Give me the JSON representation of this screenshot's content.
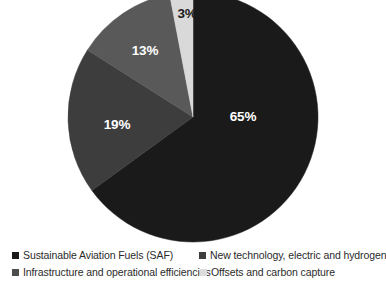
{
  "chart_data": {
    "type": "pie",
    "title": "",
    "subtitle": "",
    "xlabel": "",
    "ylabel": "",
    "grid": false,
    "legend_position": "bottom",
    "legend_columns": 2,
    "start_angle_deg": 0,
    "direction": "clockwise",
    "units": "percent",
    "total": 100,
    "categories": [
      "Sustainable Aviation Fuels (SAF)",
      "New technology, electric and hydrogen",
      "Infrastructure and operational efficiencies",
      "Offsets and carbon capture"
    ],
    "values": [
      65,
      19,
      13,
      3
    ],
    "data_labels": [
      "65%",
      "19%",
      "13%",
      "3%"
    ],
    "colors": [
      "#1a1a1a",
      "#3d3d3d",
      "#595959",
      "#d9d9d9"
    ],
    "slices": [
      {
        "label": "Sustainable Aviation Fuels (SAF)",
        "value": 65,
        "data_label": "65%",
        "color": "#1a1a1a",
        "label_color": "#ffffff",
        "label_x": 243,
        "label_y": 117
      },
      {
        "label": "New technology, electric and hydrogen",
        "value": 19,
        "data_label": "19%",
        "color": "#3d3d3d",
        "label_color": "#ffffff",
        "label_x": 117,
        "label_y": 125
      },
      {
        "label": "Infrastructure and operational efficiencies",
        "value": 13,
        "data_label": "13%",
        "color": "#595959",
        "label_color": "#ffffff",
        "label_x": 145,
        "label_y": 51
      },
      {
        "label": "Offsets and carbon capture",
        "value": 3,
        "data_label": "3%",
        "color": "#d9d9d9",
        "label_color": "#1a1a1a",
        "label_x": 187,
        "label_y": 14
      }
    ]
  },
  "legend": {
    "items": [
      {
        "label": "Sustainable Aviation Fuels (SAF)",
        "color": "#1a1a1a"
      },
      {
        "label": "New technology, electric and hydrogen",
        "color": "#3d3d3d"
      },
      {
        "label": "Infrastructure and operational efficiencies",
        "color": "#4d4d4d"
      },
      {
        "label": "Offsets and carbon capture",
        "color": "#dcdcdc"
      }
    ]
  },
  "geometry": {
    "center_x": 193,
    "center_y": 117,
    "radius": 125
  }
}
